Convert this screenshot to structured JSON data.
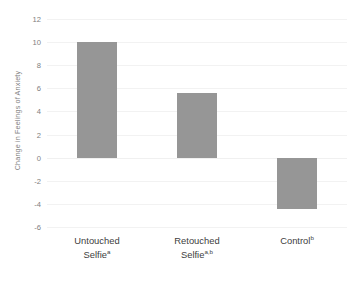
{
  "chart_data": {
    "type": "bar",
    "title": "",
    "subtitle": "",
    "xlabel": "",
    "ylabel": "Change in Feelings of Anxiety",
    "categories": [
      "Untouched Selfie",
      "Retouched Selfie",
      "Control"
    ],
    "category_superscripts": [
      "a",
      "a,b",
      "b"
    ],
    "values": [
      10.0,
      5.6,
      -4.4
    ],
    "ylim": [
      -6,
      12
    ],
    "ytick_labels": [
      "12",
      "10",
      "8",
      "6",
      "4",
      "2",
      "0",
      "-2",
      "-4",
      "-6"
    ],
    "ytick_values": [
      12,
      10,
      8,
      6,
      4,
      2,
      0,
      -2,
      -4,
      -6
    ],
    "grid": true,
    "legend": "none",
    "bar_color": "#969696",
    "gridline_color": "#F2F2F2",
    "axis_text_color": "#808080",
    "category_text_color": "#404040"
  }
}
